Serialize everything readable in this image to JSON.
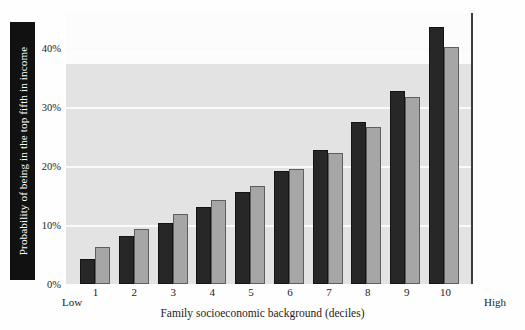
{
  "chart_data": {
    "type": "bar",
    "title": "",
    "xlabel": "Family socioeconomic background (deciles)",
    "ylabel": "Probability of being in the top fifth in income",
    "categories": [
      "1",
      "2",
      "3",
      "4",
      "5",
      "6",
      "7",
      "8",
      "9",
      "10"
    ],
    "ytick_labels": [
      "0%",
      "10%",
      "20%",
      "30%",
      "40%"
    ],
    "ytick_values": [
      0,
      10,
      20,
      30,
      40
    ],
    "ylim": [
      0,
      46
    ],
    "grid": true,
    "legend": "none",
    "axis_end_labels": {
      "left": "Low",
      "right": "High"
    },
    "series": [
      {
        "name": "dark",
        "color": "#272727",
        "values": [
          4.3,
          8.2,
          10.4,
          13.1,
          15.7,
          19.1,
          22.8,
          27.5,
          32.7,
          43.6
        ]
      },
      {
        "name": "light",
        "color": "#a6a6a6",
        "values": [
          6.2,
          9.3,
          11.9,
          14.3,
          16.6,
          19.5,
          22.2,
          26.6,
          31.7,
          40.3
        ]
      }
    ]
  }
}
